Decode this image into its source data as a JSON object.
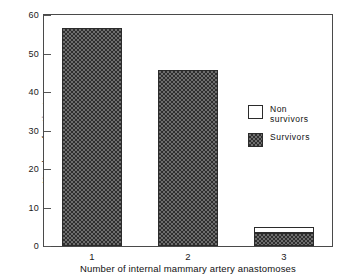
{
  "chart_data": {
    "type": "bar",
    "stacked": true,
    "title": "",
    "subtitle": "",
    "xlabel": "Number of internal mammary artery anastomoses",
    "ylabel": "Number of patients",
    "categories": [
      "1",
      "2",
      "3"
    ],
    "xtick_labels": [
      "1",
      "2",
      "3"
    ],
    "ytick_labels": [
      "0",
      "10",
      "20",
      "30",
      "40",
      "50",
      "60"
    ],
    "ytick_values": [
      0,
      10,
      20,
      30,
      40,
      50,
      60
    ],
    "ylim": [
      0,
      60
    ],
    "grid": false,
    "legend_position": "inside-right",
    "series": [
      {
        "name": "Survivors",
        "swatch": "hatched",
        "values": [
          56.5,
          45.7,
          3.5
        ]
      },
      {
        "name": "Non survivors",
        "swatch": "empty",
        "values": [
          0,
          0,
          1.5
        ]
      }
    ],
    "legend": [
      {
        "label_lines": [
          "Non",
          "survivors"
        ],
        "swatch": "empty"
      },
      {
        "label_lines": [
          "Survivors"
        ],
        "swatch": "hatched"
      }
    ],
    "colors": {
      "survivors_fill": "#6e6e6e",
      "survivors_pattern": "#2f2f2f",
      "nonsurvivors_fill": "#ffffff",
      "outline": "#2b2b2b",
      "axis": "#4a4a4a",
      "text": "#111111",
      "background": "#ffffff"
    }
  }
}
